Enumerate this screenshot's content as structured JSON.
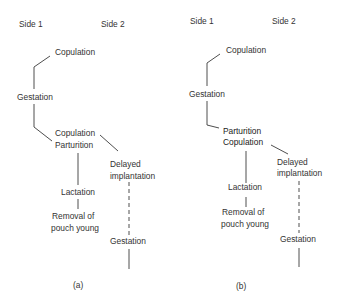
{
  "panels": [
    {
      "id": "a",
      "caption": "(a)",
      "side_labels": [
        "Side 1",
        "Side 2"
      ],
      "nodes": {
        "copulation_top": "Copulation",
        "gestation_1": "Gestation",
        "copulation_mid": "Copulation",
        "parturition": "Parturition",
        "delayed": "Delayed",
        "implantation": "implantation",
        "lactation": "Lactation",
        "removal_1": "Removal of",
        "removal_2": "pouch young",
        "gestation_2": "Gestation"
      }
    },
    {
      "id": "b",
      "caption": "(b)",
      "side_labels": [
        "Side 1",
        "Side 2"
      ],
      "nodes": {
        "copulation_top": "Copulation",
        "gestation_1": "Gestation",
        "parturition": "Parturition",
        "copulation_mid": "Copulation",
        "delayed": "Delayed",
        "implantation": "implantation",
        "lactation": "Lactation",
        "removal_1": "Removal of",
        "removal_2": "pouch young",
        "gestation_2": "Gestation"
      }
    }
  ],
  "connections": {
    "solid": "direct sequence",
    "dashed": "delayed (embryonic diapause) interval"
  },
  "colors": {
    "background": "#ffffff",
    "ink": "#333333"
  }
}
